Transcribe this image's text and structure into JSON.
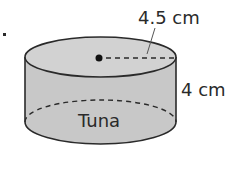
{
  "diagram": {
    "type": "cylinder",
    "label": "Tuna",
    "radius_label": "4.5 cm",
    "height_label": "4 cm",
    "item_marker": ".",
    "colors": {
      "fill_side": "#c8c8c8",
      "fill_top": "#d2d2d2",
      "stroke": "#2a2a2a",
      "text": "#2a2a2a",
      "background": "#ffffff"
    }
  }
}
